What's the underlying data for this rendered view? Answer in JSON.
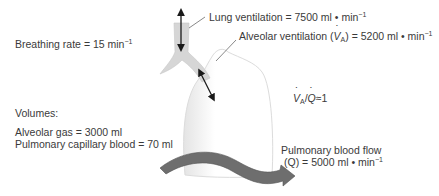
{
  "labels": {
    "breathing_rate": "Breathing rate = 15 min",
    "breathing_rate_exp": "−1",
    "lung_ventilation": "Lung ventilation = 7500 ml",
    "lung_ventilation_unit": "min",
    "lung_ventilation_exp": "−1",
    "alveolar_ventilation_pre": "Alveolar ventilation (",
    "alveolar_ventilation_sym": "V",
    "alveolar_ventilation_sub": "A",
    "alveolar_ventilation_post": ") = 5200 ml",
    "alveolar_ventilation_unit": "min",
    "alveolar_ventilation_exp": "−1",
    "ratio_v": "V",
    "ratio_sub": "A",
    "ratio_slash": "/",
    "ratio_q": "Q",
    "ratio_value": "≈1",
    "volumes_title": "Volumes:",
    "alveolar_gas": "Alveolar gas = 3000 ml",
    "pulmonary_capillary_blood": "Pulmonary capillary blood = 70 ml",
    "pulmonary_blood_flow_line1": "Pulmonary blood flow",
    "pulmonary_blood_flow_q": "Q",
    "pulmonary_blood_flow_line2": ") = 5000 ml",
    "pulmonary_blood_flow_unit": "min",
    "pulmonary_blood_flow_exp": "−1",
    "mid_dot": "•"
  },
  "colors": {
    "airway": "#d6d6d6",
    "lung": "#f2f2f2",
    "blood_flow_arrow": "#6e6e6e",
    "arrow": "#1a1a1a",
    "text": "#3a3a3a"
  }
}
